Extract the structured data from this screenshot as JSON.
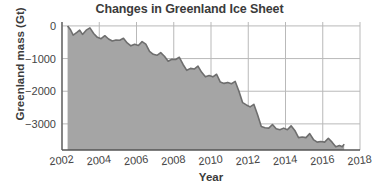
{
  "chart_data": {
    "type": "area",
    "title": "Changes in Greenland Ice Sheet",
    "xlabel": "Year",
    "ylabel": "Greenland mass (Gt)",
    "xlim": [
      2002,
      2018
    ],
    "ylim": [
      -3800,
      120
    ],
    "grid": true,
    "legend": null,
    "xticks": [
      2002,
      2004,
      2006,
      2008,
      2010,
      2012,
      2014,
      2016,
      2018
    ],
    "xtick_labels": [
      "2002",
      "2004",
      "2006",
      "2008",
      "2010",
      "2012",
      "2014",
      "2016",
      "2018"
    ],
    "yticks": [
      0,
      -1000,
      -2000,
      -3000
    ],
    "ytick_labels": [
      "0",
      "−1000",
      "−2000",
      "−3000"
    ],
    "series": [
      {
        "name": "Greenland ice mass anomaly",
        "line_color": "#6e6e6e",
        "fill_color": "#a5a5a5",
        "x": [
          2002.3,
          2002.45,
          2002.6,
          2002.8,
          2002.95,
          2003.1,
          2003.3,
          2003.5,
          2003.7,
          2003.9,
          2004.1,
          2004.3,
          2004.5,
          2004.7,
          2004.9,
          2005.1,
          2005.3,
          2005.5,
          2005.7,
          2005.9,
          2006.1,
          2006.3,
          2006.5,
          2006.7,
          2006.9,
          2007.1,
          2007.3,
          2007.5,
          2007.7,
          2007.9,
          2008.1,
          2008.3,
          2008.5,
          2008.7,
          2008.9,
          2009.1,
          2009.3,
          2009.5,
          2009.7,
          2009.9,
          2010.1,
          2010.3,
          2010.5,
          2010.7,
          2010.9,
          2011.1,
          2011.3,
          2011.5,
          2011.7,
          2011.9,
          2012.1,
          2012.3,
          2012.5,
          2012.7,
          2012.9,
          2013.1,
          2013.3,
          2013.5,
          2013.7,
          2013.9,
          2014.1,
          2014.3,
          2014.5,
          2014.7,
          2014.9,
          2015.1,
          2015.3,
          2015.5,
          2015.7,
          2015.9,
          2016.1,
          2016.3,
          2016.5,
          2016.7,
          2016.9,
          2017.05,
          2017.15
        ],
        "y": [
          0,
          -110,
          -280,
          -200,
          -130,
          -260,
          -130,
          -60,
          -230,
          -350,
          -390,
          -300,
          -400,
          -460,
          -430,
          -440,
          -380,
          -520,
          -610,
          -560,
          -600,
          -480,
          -560,
          -780,
          -870,
          -900,
          -820,
          -930,
          -1080,
          -1020,
          -1030,
          -960,
          -1180,
          -1360,
          -1300,
          -1320,
          -1230,
          -1420,
          -1560,
          -1520,
          -1560,
          -1480,
          -1720,
          -1760,
          -1730,
          -1770,
          -1700,
          -2000,
          -2350,
          -2420,
          -2480,
          -2400,
          -2720,
          -3080,
          -3120,
          -3130,
          -3020,
          -3150,
          -3180,
          -3130,
          -3180,
          -3060,
          -3200,
          -3420,
          -3400,
          -3420,
          -3300,
          -3480,
          -3560,
          -3540,
          -3560,
          -3440,
          -3560,
          -3700,
          -3660,
          -3700,
          -3620
        ]
      }
    ]
  },
  "figure": {
    "background_color": "#ffffff",
    "axis_color": "#555555",
    "grid_color": "#b9b9b9",
    "text_color": "#3b3b3b"
  }
}
